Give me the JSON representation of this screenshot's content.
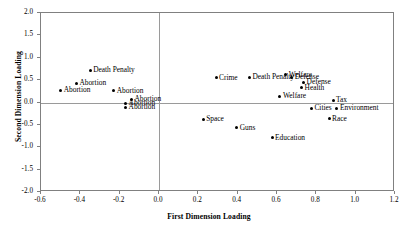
{
  "chart_data": {
    "type": "scatter",
    "title": "",
    "xlabel": "First Dimension Loading",
    "ylabel": "Second Dimension Loading",
    "xlim": [
      -0.6,
      1.2
    ],
    "ylim": [
      -2.0,
      2.0
    ],
    "xticks": [
      "-0.6",
      "-0.4",
      "-0.2",
      "0.0",
      "0.2",
      "0.4",
      "0.6",
      "0.8",
      "1.0",
      "1.2"
    ],
    "xtick_values": [
      -0.6,
      -0.4,
      -0.2,
      0.0,
      0.2,
      0.4,
      0.6,
      0.8,
      1.0,
      1.2
    ],
    "yticks": [
      "2.0",
      "1.5",
      "1.0",
      "0.5",
      "0.0",
      "-0.5",
      "-1.0",
      "-1.5",
      "-2.0"
    ],
    "ytick_values": [
      2.0,
      1.5,
      1.0,
      0.5,
      0.0,
      -0.5,
      -1.0,
      -1.5,
      -2.0
    ],
    "grid": false,
    "legend": "none",
    "zero_lines": {
      "x": 0.0,
      "y": 0.0
    },
    "marker": "filled-circle",
    "marker_color": "#000000",
    "points": [
      {
        "label": "Death Penalty",
        "x": -0.35,
        "y": 0.72,
        "anchor": "right"
      },
      {
        "label": "Abortion",
        "x": -0.42,
        "y": 0.43,
        "anchor": "right"
      },
      {
        "label": "Abortion",
        "x": -0.5,
        "y": 0.27,
        "anchor": "right"
      },
      {
        "label": "Abortion",
        "x": -0.23,
        "y": 0.26,
        "anchor": "right"
      },
      {
        "label": "Abortion",
        "x": -0.14,
        "y": 0.07,
        "anchor": "right"
      },
      {
        "label": "Abortion",
        "x": -0.17,
        "y": -0.02,
        "anchor": "right"
      },
      {
        "label": "Abortion",
        "x": -0.17,
        "y": -0.11,
        "anchor": "right"
      },
      {
        "label": "Crime",
        "x": 0.29,
        "y": 0.55,
        "anchor": "right"
      },
      {
        "label": "Death Penalty",
        "x": 0.46,
        "y": 0.56,
        "anchor": "right"
      },
      {
        "label": "Welfare",
        "x": 0.645,
        "y": 0.62,
        "anchor": "right"
      },
      {
        "label": "Defense",
        "x": 0.675,
        "y": 0.56,
        "anchor": "right"
      },
      {
        "label": "Defense",
        "x": 0.735,
        "y": 0.45,
        "anchor": "right"
      },
      {
        "label": "Health",
        "x": 0.725,
        "y": 0.33,
        "anchor": "right"
      },
      {
        "label": "Welfare",
        "x": 0.615,
        "y": 0.14,
        "anchor": "right"
      },
      {
        "label": "Tax",
        "x": 0.885,
        "y": 0.05,
        "anchor": "right"
      },
      {
        "label": "Cities",
        "x": 0.775,
        "y": -0.13,
        "anchor": "right"
      },
      {
        "label": "Environment",
        "x": 0.905,
        "y": -0.13,
        "anchor": "right"
      },
      {
        "label": "Race",
        "x": 0.865,
        "y": -0.36,
        "anchor": "right"
      },
      {
        "label": "Space",
        "x": 0.225,
        "y": -0.37,
        "anchor": "right"
      },
      {
        "label": "Guns",
        "x": 0.395,
        "y": -0.56,
        "anchor": "right"
      },
      {
        "label": "Education",
        "x": 0.575,
        "y": -0.79,
        "anchor": "right"
      }
    ]
  }
}
